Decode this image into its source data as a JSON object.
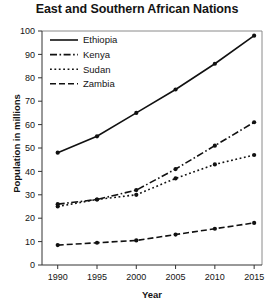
{
  "chart_data": {
    "type": "line",
    "title": "East and Southern African Nations",
    "xlabel": "Year",
    "ylabel": "Population in millions",
    "x": [
      1990,
      1995,
      2000,
      2005,
      2010,
      2015
    ],
    "xtick_labels": [
      "1990",
      "1995",
      "2000",
      "2005",
      "2010",
      "2015"
    ],
    "ytick_labels": [
      "0",
      "10",
      "20",
      "30",
      "40",
      "50",
      "60",
      "70",
      "80",
      "90",
      "100"
    ],
    "ylim": [
      0,
      100
    ],
    "xlim": [
      1988,
      2016
    ],
    "ytick_step": 10,
    "grid": false,
    "legend_position": "top-left",
    "series": [
      {
        "name": "Ethiopia",
        "style": "solid",
        "values": [
          48,
          55,
          65,
          75,
          86,
          98
        ]
      },
      {
        "name": "Kenya",
        "style": "dash-dot",
        "values": [
          26,
          28,
          32,
          41,
          51,
          61
        ]
      },
      {
        "name": "Sudan",
        "style": "dotted",
        "values": [
          25,
          28,
          30,
          37,
          43,
          47
        ]
      },
      {
        "name": "Zambia",
        "style": "dashed",
        "values": [
          8.5,
          9.5,
          10.5,
          13,
          15.5,
          18
        ]
      }
    ]
  },
  "colors": {
    "line": "#111111",
    "axis": "#333333",
    "frame": "#8a8a8a",
    "text": "#141414",
    "background": "#ffffff"
  }
}
